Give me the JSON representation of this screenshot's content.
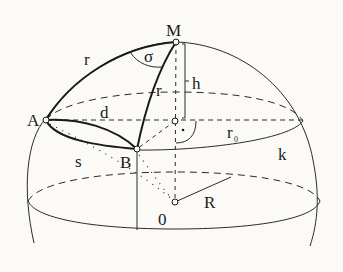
{
  "figure": {
    "type": "spherical geometry diagram",
    "background": "#fbfaf6",
    "stroke_color": "#2a2a2a"
  },
  "points": {
    "M": {
      "label": "M"
    },
    "A": {
      "label": "A"
    },
    "B": {
      "label": "B"
    },
    "O": {
      "label": "0"
    }
  },
  "labels": {
    "r_arc_MA": "r",
    "r_arc_MB": "r",
    "sigma": "σ",
    "h": "h",
    "d": "d",
    "s": "s",
    "r0": "r",
    "r0_sub": "0",
    "k": "k",
    "R": "R"
  }
}
